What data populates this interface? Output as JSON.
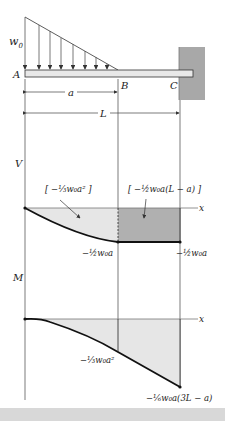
{
  "figure": {
    "beam": {
      "load_label": "w0",
      "load_label_main": "w",
      "load_label_sub": "0",
      "points": [
        "A",
        "B",
        "C"
      ],
      "dimensions": {
        "a": "a",
        "L": "L"
      }
    },
    "shear_diagram": {
      "axis_label": "V",
      "x_label": "x",
      "area_label_1": "[ −⅓w₀a² ]",
      "area_label_2": "[ −½w₀a(L − a) ]",
      "value_at_B": "−½w₀a",
      "value_at_C": "−½w₀a"
    },
    "moment_diagram": {
      "axis_label": "M",
      "x_label": "x",
      "value_at_B": "−⅓w₀a²",
      "value_at_C": "−⅙w₀a(3L − a)"
    }
  },
  "colors": {
    "wall": "#a8a8a8",
    "light_fill": "#e6e6e6",
    "dark_fill": "#b0b0b0",
    "line": "#222222",
    "bottom_bar": "#d8d8d8"
  }
}
